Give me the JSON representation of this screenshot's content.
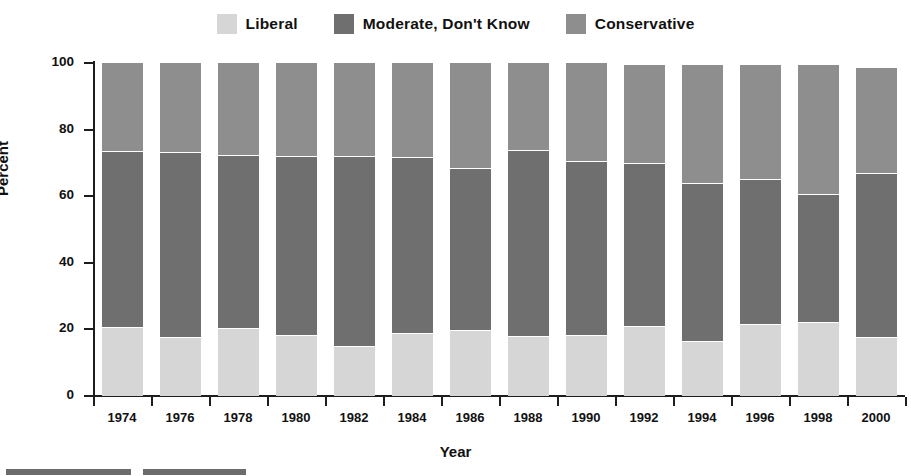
{
  "chart_data": {
    "type": "bar",
    "subtype": "stacked-bar-percent",
    "title": "",
    "xlabel": "Year",
    "ylabel": "Percent",
    "ylim": [
      0,
      100
    ],
    "yticks": [
      0,
      20,
      40,
      60,
      80,
      100
    ],
    "grid": false,
    "legend_position": "top-center",
    "categories": [
      "1974",
      "1976",
      "1978",
      "1980",
      "1982",
      "1984",
      "1986",
      "1988",
      "1990",
      "1992",
      "1994",
      "1996",
      "1998",
      "2000"
    ],
    "series": [
      {
        "name": "Liberal",
        "color": "#d6d6d6",
        "values": [
          20.8,
          17.8,
          20.3,
          18.3,
          15.0,
          19.0,
          19.8,
          18.0,
          18.3,
          21.0,
          16.6,
          21.6,
          22.3,
          17.8
        ]
      },
      {
        "name": "Moderate, Don't Know",
        "color": "#6f6f6f",
        "values": [
          52.9,
          55.6,
          52.0,
          53.9,
          57.0,
          52.9,
          48.6,
          55.8,
          52.2,
          48.9,
          47.4,
          43.7,
          38.4,
          49.3
        ]
      },
      {
        "name": "Conservative",
        "color": "#8e8e8e",
        "values": [
          26.3,
          26.6,
          27.7,
          27.8,
          28.0,
          28.1,
          31.6,
          26.2,
          29.5,
          29.6,
          35.4,
          34.2,
          38.6,
          31.4
        ]
      }
    ],
    "cumulative_upper_bounds": [
      [
        20.8,
        73.7,
        100.0
      ],
      [
        17.8,
        73.4,
        100.0
      ],
      [
        20.3,
        72.3,
        100.0
      ],
      [
        18.3,
        72.2,
        100.0
      ],
      [
        15.0,
        72.0,
        100.0
      ],
      [
        19.0,
        71.9,
        100.0
      ],
      [
        19.8,
        68.4,
        100.0
      ],
      [
        18.0,
        73.8,
        100.0
      ],
      [
        18.3,
        70.5,
        100.0
      ],
      [
        21.0,
        69.9,
        99.5
      ],
      [
        16.6,
        64.0,
        99.4
      ],
      [
        21.6,
        65.3,
        99.5
      ],
      [
        22.3,
        60.7,
        99.3
      ],
      [
        17.8,
        67.1,
        98.5
      ]
    ]
  },
  "legend": {
    "items": [
      {
        "label": "Liberal",
        "color": "#d6d6d6"
      },
      {
        "label": "Moderate, Don't Know",
        "color": "#6f6f6f"
      },
      {
        "label": "Conservative",
        "color": "#8e8e8e"
      }
    ]
  },
  "axes": {
    "y_title": "Percent",
    "x_title": "Year",
    "y_tick_labels": [
      "100",
      "80",
      "60",
      "40",
      "20",
      "0"
    ],
    "x_tick_labels": [
      "1974",
      "1976",
      "1978",
      "1980",
      "1982",
      "1984",
      "1986",
      "1988",
      "1990",
      "1992",
      "1994",
      "1996",
      "1998",
      "2000"
    ]
  }
}
